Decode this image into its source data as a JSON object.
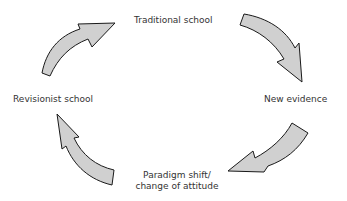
{
  "diagram": {
    "type": "cycle",
    "direction": "clockwise",
    "nodes": [
      {
        "id": "traditional",
        "label": "Traditional school"
      },
      {
        "id": "evidence",
        "label": "New evidence"
      },
      {
        "id": "paradigm",
        "label_line1": "Paradigm shift/",
        "label_line2": "change of attitude"
      },
      {
        "id": "revisionist",
        "label": "Revisionist school"
      }
    ],
    "edges": [
      {
        "from": "traditional",
        "to": "evidence"
      },
      {
        "from": "evidence",
        "to": "paradigm"
      },
      {
        "from": "paradigm",
        "to": "revisionist"
      },
      {
        "from": "revisionist",
        "to": "traditional"
      }
    ],
    "colors": {
      "arrow_fill": "#d0d0d0",
      "arrow_stroke": "#1a1a1a",
      "text": "#333333"
    }
  }
}
